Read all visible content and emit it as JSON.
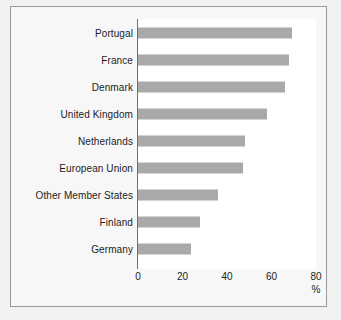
{
  "chart_data": {
    "type": "bar",
    "orientation": "horizontal",
    "title": "",
    "xlabel": "%",
    "ylabel": "",
    "xlim": [
      0,
      80
    ],
    "xticks": [
      0,
      20,
      40,
      60,
      80
    ],
    "grid": false,
    "legend": null,
    "bar_color": "#a9a9a9",
    "plot_background": "#ffffff",
    "figure_background": "#f7f7f7",
    "page_background": "#f2f2f2",
    "border_color": "#9a9a9a",
    "categories": [
      "Portugal",
      "France",
      "Denmark",
      "United Kingdom",
      "Netherlands",
      "European Union",
      "Other Member States",
      "Finland",
      "Germany"
    ],
    "values": [
      69,
      68,
      66,
      58,
      48,
      47,
      36,
      28,
      24
    ]
  },
  "axis": {
    "unit": "%",
    "tick_labels": [
      "0",
      "20",
      "40",
      "60",
      "80"
    ]
  }
}
